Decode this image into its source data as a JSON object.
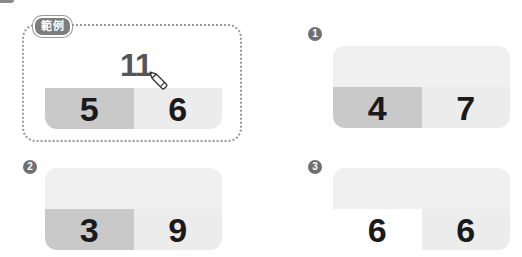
{
  "example": {
    "label": "範例",
    "total": "11",
    "parts": [
      "5",
      "6"
    ],
    "icon": "pencil-icon"
  },
  "exercises": [
    {
      "badge": "1",
      "total": "",
      "parts": [
        "4",
        "7"
      ]
    },
    {
      "badge": "2",
      "total": "",
      "parts": [
        "3",
        "9"
      ]
    },
    {
      "badge": "3",
      "total": "",
      "parts": [
        "6",
        "6"
      ]
    }
  ],
  "colors": {
    "dark_cell": "#c9c9c9",
    "light_cell": "#ececec",
    "top_band": "#f0f0f0",
    "badge": "#707070",
    "dotted_border": "#9a9a9a",
    "total_text": "#555555",
    "part_text": "#1a1a1a"
  }
}
